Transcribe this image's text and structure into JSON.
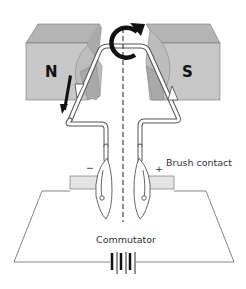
{
  "diagram": {
    "magnets": {
      "north_label": "N",
      "south_label": "S",
      "face_color": "#c8c8c8",
      "top_color": "#b4b4b4"
    },
    "labels": {
      "negative": "−",
      "positive": "+",
      "brush_contact": "Brush contact",
      "commutator": "Commutator"
    },
    "symbols": {
      "rotation": "rotation-arrow",
      "force": "force-arrow-down",
      "current": "current-direction-arrows",
      "axis": "dashed-rotation-axis",
      "battery": "battery-cells"
    }
  }
}
